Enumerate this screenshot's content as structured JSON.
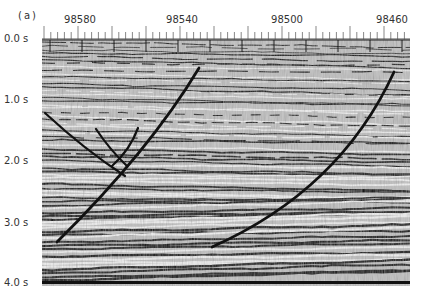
{
  "figure": {
    "panel_label": "(a)",
    "type": "seismic reflection section with interpreted faults",
    "trace_labels": [
      {
        "text": "98580",
        "x": 80
      },
      {
        "text": "98540",
        "x": 182
      },
      {
        "text": "98500",
        "x": 287
      },
      {
        "text": "98460",
        "x": 392
      }
    ],
    "time_labels": [
      {
        "text": "0.0 s",
        "y": 38
      },
      {
        "text": "1.0 s",
        "y": 99
      },
      {
        "text": "2.0 s",
        "y": 160
      },
      {
        "text": "3.0 s",
        "y": 222
      },
      {
        "text": "4.0 s",
        "y": 282
      }
    ],
    "faults": [
      {
        "name": "fault-1",
        "path": "M199,68 Q150,150 57,242"
      },
      {
        "name": "fault-2",
        "path": "M394,72 Q340,190 212,247"
      },
      {
        "name": "fault-branch-left",
        "path": "M45,113 Q85,150 125,176"
      },
      {
        "name": "fault-branch-inner",
        "path": "M96,129 Q110,150 127,166"
      },
      {
        "name": "fault-branch-right",
        "path": "M138,128 Q130,150 112,166"
      }
    ],
    "colors": {
      "background": "#ffffff",
      "ink": "#111111",
      "noise": "#9a9a9a"
    }
  }
}
